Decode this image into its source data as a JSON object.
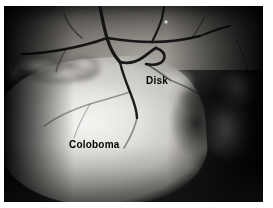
{
  "figure": {
    "kind": "fundus-photograph",
    "frame_color": "#ffffff",
    "plate_color": "#0a0a0a"
  },
  "annotations": [
    {
      "id": "disk",
      "text": "Disk",
      "color": "#000000",
      "x": 146,
      "y": 76
    },
    {
      "id": "coloboma",
      "text": "Coloboma",
      "color": "#000000",
      "x": 69,
      "y": 140
    }
  ],
  "regions": {
    "coloboma_label": "Coloboma",
    "disk_label": "Disk"
  }
}
